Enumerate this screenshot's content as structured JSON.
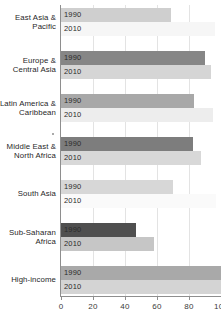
{
  "chart_data": {
    "type": "bar",
    "orientation": "horizontal",
    "title": "",
    "subtitle": "",
    "xlabel": "",
    "ylabel": "",
    "xlim": [
      0,
      100
    ],
    "ylim": null,
    "grid": true,
    "legend_position": "none",
    "xticks": [
      0,
      20,
      40,
      60,
      80,
      100
    ],
    "xticklabels": [
      "0",
      "20",
      "40",
      "60",
      "80",
      "100"
    ],
    "categories": [
      "East Asia & Pacific",
      "Europe & Central Asia",
      "Latin America & Caribbean",
      "Middle East & North Africa",
      "South Asia",
      "Sub-Saharan Africa",
      "High-income"
    ],
    "series": [
      {
        "name": "1990",
        "values": [
          69,
          90,
          83,
          82.5,
          70,
          47,
          100
        ]
      },
      {
        "name": "2010",
        "values": [
          96,
          94,
          95,
          87.5,
          97,
          58,
          100
        ]
      }
    ],
    "bars": [
      {
        "category_lines": [
          "East Asia &",
          "Pacific"
        ],
        "rows": [
          {
            "series": "1990",
            "value": 69,
            "color": "#cfcfcf"
          },
          {
            "series": "2010",
            "value": 96,
            "color": "#f6f6f6"
          }
        ]
      },
      {
        "category_lines": [
          "Europe &",
          "Central Asia"
        ],
        "rows": [
          {
            "series": "1990",
            "value": 90,
            "color": "#868686"
          },
          {
            "series": "2010",
            "value": 94,
            "color": "#d5d5d5"
          }
        ]
      },
      {
        "category_lines": [
          "Latin America &",
          "Caribbean"
        ],
        "rows": [
          {
            "series": "1990",
            "value": 83,
            "color": "#a8a8a8"
          },
          {
            "series": "2010",
            "value": 95,
            "color": "#ededed"
          }
        ]
      },
      {
        "category_lines": [
          "Middle East &",
          "North Africa"
        ],
        "rows": [
          {
            "series": "1990",
            "value": 82.5,
            "color": "#7d7d7d"
          },
          {
            "series": "2010",
            "value": 87.5,
            "color": "#d8d8d8"
          }
        ]
      },
      {
        "category_lines": [
          "South Asia"
        ],
        "rows": [
          {
            "series": "1990",
            "value": 70,
            "color": "#d7d7d7"
          },
          {
            "series": "2010",
            "value": 97,
            "color": "#fafafa"
          }
        ]
      },
      {
        "category_lines": [
          "Sub-Saharan",
          "Africa"
        ],
        "rows": [
          {
            "series": "1990",
            "value": 47,
            "color": "#4f4f4f"
          },
          {
            "series": "2010",
            "value": 58,
            "color": "#c6c6c6"
          }
        ]
      },
      {
        "category_lines": [
          "High-income"
        ],
        "rows": [
          {
            "series": "1990",
            "value": 100,
            "color": "#a9a9a9"
          },
          {
            "series": "2010",
            "value": 100,
            "color": "#d4d4d4"
          }
        ]
      }
    ],
    "colors": {
      "axis": "#8e8e8e",
      "grid": "#e3e3e3",
      "text": "#2b2b2b",
      "background": "#ffffff"
    }
  }
}
